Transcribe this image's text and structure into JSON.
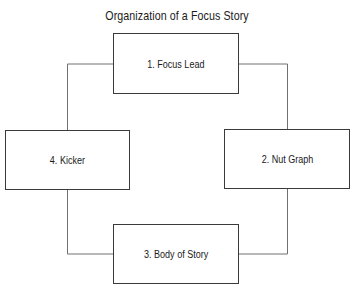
{
  "title": "Organization of a Focus Story",
  "nodes": [
    {
      "id": "focus-lead",
      "label": "1. Focus Lead",
      "position": "top"
    },
    {
      "id": "nut-graph",
      "label": "2. Nut Graph",
      "position": "right"
    },
    {
      "id": "body-of-story",
      "label": "3. Body of Story",
      "position": "bottom"
    },
    {
      "id": "kicker",
      "label": "4. Kicker",
      "position": "left"
    }
  ],
  "edges": [
    {
      "from": "focus-lead",
      "to": "nut-graph"
    },
    {
      "from": "nut-graph",
      "to": "body-of-story"
    },
    {
      "from": "body-of-story",
      "to": "kicker"
    },
    {
      "from": "kicker",
      "to": "focus-lead"
    }
  ],
  "colors": {
    "border": "#3a3a3a",
    "connector": "#707070",
    "text": "#1a1a1a",
    "background": "#ffffff"
  }
}
